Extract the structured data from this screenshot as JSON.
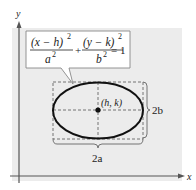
{
  "diagram": {
    "type": "ellipse-standard-form",
    "axes": {
      "x_label": "x",
      "y_label": "y"
    },
    "equation": {
      "term1_numerator": "(x − h)",
      "term1_numerator_exp": "2",
      "term1_denominator": "a",
      "term1_denominator_exp": "2",
      "plus": "+",
      "term2_numerator": "(y − k)",
      "term2_numerator_exp": "2",
      "term2_denominator": "b",
      "term2_denominator_exp": "2",
      "equals": "= 1"
    },
    "center_label": "(h, k)",
    "horizontal_dimension_label": "2a",
    "vertical_dimension_label": "2b",
    "colors": {
      "panel_background": "#ececec",
      "axis": "#555555",
      "ellipse": "#111111",
      "dashed": "#666666",
      "callout_border": "#888888"
    }
  }
}
